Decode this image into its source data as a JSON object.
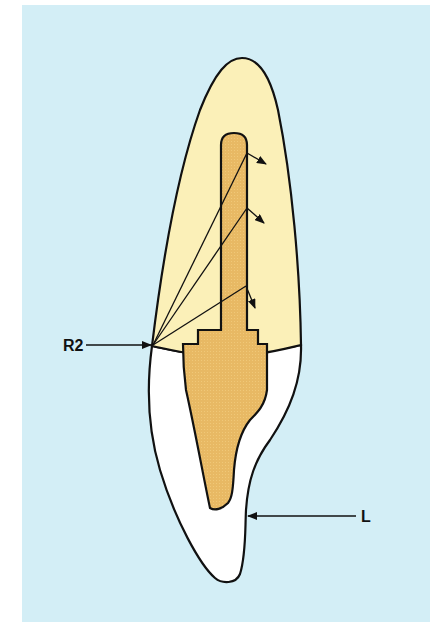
{
  "figure": {
    "type": "dental cross-section diagram (tooth with post and core crown)",
    "colors": {
      "background": "#d3eef6",
      "crown": "#fbf0b8",
      "post_core": "#e8b964",
      "root": "#ffffff",
      "outline": "#111111"
    },
    "labels": [
      {
        "id": "r2",
        "text": "R2"
      },
      {
        "id": "l",
        "text": "L"
      }
    ],
    "force_lines": 3
  }
}
